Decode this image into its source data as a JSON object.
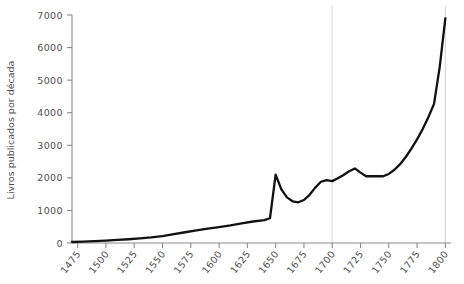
{
  "chart_data": {
    "type": "line",
    "title": "",
    "subtitle": "",
    "xlabel": "",
    "ylabel": "Livros publicados por década",
    "xlim": [
      1470,
      1805
    ],
    "ylim": [
      0,
      7000
    ],
    "grid": false,
    "legend": "none",
    "line_color": "#111111",
    "gridline_color": "#cccccc",
    "axis_color": "#8a8a8a",
    "vertical_gridlines": [
      1700,
      1800
    ],
    "y_ticks": [
      0,
      1000,
      2000,
      3000,
      4000,
      5000,
      6000,
      7000
    ],
    "y_tick_labels": [
      "0",
      "1000",
      "2000",
      "3000",
      "4000",
      "5000",
      "6000",
      "7000"
    ],
    "x_ticks": [
      1475,
      1500,
      1525,
      1550,
      1575,
      1600,
      1625,
      1650,
      1675,
      1700,
      1725,
      1750,
      1775,
      1800
    ],
    "x_tick_labels": [
      "1475",
      "1500",
      "1525",
      "1550",
      "1575",
      "1600",
      "1625",
      "1650",
      "1675",
      "1700",
      "1725",
      "1750",
      "1775",
      "1800"
    ],
    "x": [
      1470,
      1480,
      1490,
      1500,
      1510,
      1520,
      1530,
      1540,
      1550,
      1560,
      1570,
      1580,
      1590,
      1600,
      1610,
      1620,
      1630,
      1640,
      1645,
      1650,
      1655,
      1660,
      1665,
      1670,
      1675,
      1680,
      1685,
      1690,
      1695,
      1700,
      1705,
      1710,
      1715,
      1720,
      1725,
      1730,
      1735,
      1740,
      1745,
      1750,
      1755,
      1760,
      1765,
      1770,
      1775,
      1780,
      1785,
      1790,
      1795,
      1800
    ],
    "y": [
      30,
      45,
      60,
      75,
      95,
      115,
      140,
      170,
      210,
      270,
      330,
      390,
      440,
      490,
      540,
      600,
      660,
      700,
      760,
      2100,
      1650,
      1400,
      1280,
      1250,
      1320,
      1480,
      1700,
      1880,
      1930,
      1900,
      1990,
      2090,
      2200,
      2290,
      2160,
      2050,
      2050,
      2050,
      2050,
      2120,
      2250,
      2420,
      2640,
      2900,
      3180,
      3500,
      3860,
      4270,
      5400,
      6900
    ],
    "series": [
      {
        "name": "Livros publicados por década",
        "values": [
          30,
          45,
          60,
          75,
          95,
          115,
          140,
          170,
          210,
          270,
          330,
          390,
          440,
          490,
          540,
          600,
          660,
          700,
          760,
          2100,
          1650,
          1400,
          1280,
          1250,
          1320,
          1480,
          1700,
          1880,
          1930,
          1900,
          1990,
          2090,
          2200,
          2290,
          2160,
          2050,
          2050,
          2050,
          2050,
          2120,
          2250,
          2420,
          2640,
          2900,
          3180,
          3500,
          3860,
          4270,
          5400,
          6900
        ]
      }
    ],
    "annotations": []
  },
  "axis": {
    "y_title": "Livros publicados por década"
  }
}
